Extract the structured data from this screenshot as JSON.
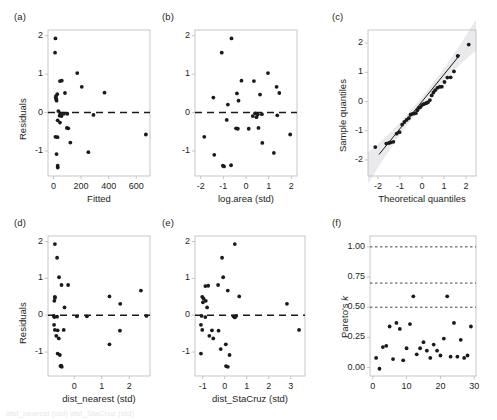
{
  "figure": {
    "width": 497,
    "height": 420,
    "background": "#ffffff",
    "point_color": "#1a1a1a",
    "axis_color": "#b9b9bd",
    "text_color": "#231f20",
    "dashed_line_color": "#1a1a1a",
    "band_color": "#d9d9de",
    "caption_fragment": "dist_nearest (std)  dist_StaCruz (std)"
  },
  "panels": {
    "a": {
      "label": "(a)",
      "xlabel": "Fitted",
      "ylabel": "Residuals"
    },
    "b": {
      "label": "(b)",
      "xlabel": "log.area (std)",
      "ylabel": ""
    },
    "c": {
      "label": "(c)",
      "xlabel": "Theoretical quantiles",
      "ylabel": "Sample quantiles"
    },
    "d": {
      "label": "(d)",
      "xlabel": "dist_nearest (std)",
      "ylabel": "Residuals"
    },
    "e": {
      "label": "(e)",
      "xlabel": "dist_StaCruz (std)",
      "ylabel": ""
    },
    "f": {
      "label": "(f)",
      "xlabel": "",
      "ylabel": "Pareto's k"
    }
  },
  "chart_data": [
    {
      "id": "a",
      "type": "scatter",
      "title": "(a)",
      "xlabel": "Fitted",
      "ylabel": "Residuals",
      "xlim": [
        -40,
        700
      ],
      "ylim": [
        -1.65,
        2.15
      ],
      "xticks": [
        0,
        200,
        400,
        600
      ],
      "yticks": [
        -1,
        0,
        1,
        2
      ],
      "xticklabels": [
        "0",
        "200",
        "400",
        "600"
      ],
      "yticklabels": [
        "-1",
        "0",
        "1",
        "2"
      ],
      "grid": false,
      "reference_line": {
        "type": "hline",
        "y": 0,
        "style": "dashed"
      },
      "points": [
        [
          14,
          1.93
        ],
        [
          11,
          1.56
        ],
        [
          172,
          1.03
        ],
        [
          60,
          0.83
        ],
        [
          47,
          0.82
        ],
        [
          205,
          0.67
        ],
        [
          370,
          0.52
        ],
        [
          83,
          0.51
        ],
        [
          27,
          0.48
        ],
        [
          18,
          0.43
        ],
        [
          16,
          0.39
        ],
        [
          20,
          0.35
        ],
        [
          22,
          0.31
        ],
        [
          35,
          0.04
        ],
        [
          50,
          -0.02
        ],
        [
          75,
          -0.03
        ],
        [
          100,
          -0.03
        ],
        [
          290,
          -0.06
        ],
        [
          44,
          -0.08
        ],
        [
          58,
          -0.09
        ],
        [
          30,
          -0.2
        ],
        [
          47,
          -0.26
        ],
        [
          97,
          -0.4
        ],
        [
          107,
          -0.41
        ],
        [
          670,
          -0.57
        ],
        [
          14,
          -0.63
        ],
        [
          29,
          -0.64
        ],
        [
          122,
          -0.78
        ],
        [
          22,
          -1.08
        ],
        [
          253,
          -1.03
        ],
        [
          30,
          -1.38
        ],
        [
          31,
          -1.43
        ]
      ]
    },
    {
      "id": "b",
      "type": "scatter",
      "title": "(b)",
      "xlabel": "log.area (std)",
      "ylabel": "Residuals",
      "xlim": [
        -2.25,
        2.25
      ],
      "ylim": [
        -1.65,
        2.15
      ],
      "xticks": [
        -2,
        -1,
        0,
        1,
        2
      ],
      "yticks": [
        -1,
        0,
        1,
        2
      ],
      "xticklabels": [
        "-2",
        "-1",
        "0",
        "1",
        "2"
      ],
      "yticklabels": [
        "-1",
        "0",
        "1",
        "2"
      ],
      "grid": false,
      "reference_line": {
        "type": "hline",
        "y": 0,
        "style": "dashed"
      },
      "points": [
        [
          -0.64,
          1.93
        ],
        [
          -1.07,
          1.56
        ],
        [
          0.97,
          1.03
        ],
        [
          -0.2,
          0.83
        ],
        [
          0.35,
          0.82
        ],
        [
          1.35,
          0.67
        ],
        [
          1.47,
          0.51
        ],
        [
          -0.4,
          0.5
        ],
        [
          0.62,
          0.47
        ],
        [
          -1.44,
          0.39
        ],
        [
          -0.33,
          0.31
        ],
        [
          -0.8,
          0.21
        ],
        [
          0.4,
          -0.02
        ],
        [
          0.52,
          -0.05
        ],
        [
          0.7,
          -0.04
        ],
        [
          1.38,
          -0.07
        ],
        [
          0.3,
          -0.09
        ],
        [
          0.46,
          -0.12
        ],
        [
          -0.85,
          -0.19
        ],
        [
          -0.44,
          -0.41
        ],
        [
          -0.36,
          -0.42
        ],
        [
          0.12,
          -0.42
        ],
        [
          0.55,
          -0.4
        ],
        [
          1.95,
          -0.57
        ],
        [
          -1.84,
          -0.63
        ],
        [
          0.72,
          -0.79
        ],
        [
          -1.4,
          -1.1
        ],
        [
          1.23,
          -1.05
        ],
        [
          -1.02,
          -1.38
        ],
        [
          -0.97,
          -1.4
        ],
        [
          -0.66,
          -1.37
        ]
      ]
    },
    {
      "id": "c",
      "type": "scatter",
      "title": "(c)",
      "xlabel": "Theoretical quantiles",
      "ylabel": "Sample quantiles",
      "xlim": [
        -2.45,
        2.45
      ],
      "ylim": [
        -2.55,
        2.45
      ],
      "xticks": [
        -2,
        -1,
        0,
        1,
        2
      ],
      "yticks": [
        -2,
        -1,
        0,
        1,
        2
      ],
      "xticklabels": [
        "-2",
        "-1",
        "0",
        "1",
        "2"
      ],
      "yticklabels": [
        "-2",
        "-1",
        "0",
        "1",
        "2"
      ],
      "grid": false,
      "reference_line": {
        "type": "qq-line",
        "slope": 0.93,
        "intercept": 0.0
      },
      "confidence_band": true,
      "points": [
        [
          -2.12,
          -1.56
        ],
        [
          -1.62,
          -1.44
        ],
        [
          -1.5,
          -1.42
        ],
        [
          -1.42,
          -1.4
        ],
        [
          -1.3,
          -1.38
        ],
        [
          -1.15,
          -1.1
        ],
        [
          -1.02,
          -1.05
        ],
        [
          -0.9,
          -0.79
        ],
        [
          -0.8,
          -0.7
        ],
        [
          -0.7,
          -0.63
        ],
        [
          -0.6,
          -0.57
        ],
        [
          -0.52,
          -0.45
        ],
        [
          -0.44,
          -0.42
        ],
        [
          -0.36,
          -0.41
        ],
        [
          -0.28,
          -0.4
        ],
        [
          -0.21,
          -0.3
        ],
        [
          -0.14,
          -0.22
        ],
        [
          -0.07,
          -0.19
        ],
        [
          0.0,
          -0.12
        ],
        [
          0.07,
          -0.09
        ],
        [
          0.14,
          -0.07
        ],
        [
          0.21,
          -0.05
        ],
        [
          0.28,
          -0.02
        ],
        [
          0.36,
          0.05
        ],
        [
          0.44,
          0.21
        ],
        [
          0.52,
          0.31
        ],
        [
          0.6,
          0.39
        ],
        [
          0.7,
          0.47
        ],
        [
          0.8,
          0.5
        ],
        [
          0.9,
          0.51
        ],
        [
          1.02,
          0.67
        ],
        [
          1.15,
          0.82
        ],
        [
          1.3,
          0.83
        ],
        [
          1.45,
          1.03
        ],
        [
          1.62,
          1.56
        ],
        [
          2.12,
          1.95
        ]
      ]
    },
    {
      "id": "d",
      "type": "scatter",
      "title": "(d)",
      "xlabel": "dist_nearest (std)",
      "ylabel": "Residuals",
      "xlim": [
        -0.95,
        2.75
      ],
      "ylim": [
        -1.65,
        2.15
      ],
      "xticks": [
        0,
        1,
        2
      ],
      "yticks": [
        -1,
        0,
        1,
        2
      ],
      "xticklabels": [
        "0",
        "1",
        "2"
      ],
      "yticklabels": [
        "-1",
        "0",
        "1",
        "2"
      ],
      "grid": false,
      "reference_line": {
        "type": "hline",
        "y": 0,
        "style": "dashed"
      },
      "points": [
        [
          -0.7,
          1.93
        ],
        [
          -0.62,
          1.56
        ],
        [
          -0.55,
          1.03
        ],
        [
          -0.46,
          0.82
        ],
        [
          -0.22,
          0.82
        ],
        [
          2.42,
          0.67
        ],
        [
          1.28,
          0.51
        ],
        [
          1.67,
          0.31
        ],
        [
          -0.7,
          0.5
        ],
        [
          -0.7,
          0.47
        ],
        [
          -0.72,
          0.39
        ],
        [
          -0.35,
          0.21
        ],
        [
          -0.74,
          -0.02
        ],
        [
          -0.72,
          -0.05
        ],
        [
          -0.62,
          -0.04
        ],
        [
          0.1,
          -0.03
        ],
        [
          0.46,
          -0.03
        ],
        [
          2.62,
          -0.02
        ],
        [
          -0.73,
          -0.26
        ],
        [
          -0.7,
          -0.4
        ],
        [
          -0.6,
          -0.41
        ],
        [
          -0.38,
          -0.4
        ],
        [
          1.66,
          -0.42
        ],
        [
          -0.65,
          -0.56
        ],
        [
          -0.56,
          -0.63
        ],
        [
          1.28,
          -0.79
        ],
        [
          -0.6,
          -1.04
        ],
        [
          -0.52,
          -1.08
        ],
        [
          -0.5,
          -1.38
        ],
        [
          -0.45,
          -1.4
        ],
        [
          -0.47,
          -1.37
        ]
      ]
    },
    {
      "id": "e",
      "type": "scatter",
      "title": "(e)",
      "xlabel": "dist_StaCruz (std)",
      "ylabel": "Residuals",
      "xlim": [
        -1.35,
        3.65
      ],
      "ylim": [
        -1.65,
        2.15
      ],
      "xticks": [
        -1,
        0,
        1,
        2,
        3
      ],
      "yticks": [
        -1,
        0,
        1,
        2
      ],
      "xticklabels": [
        "-1",
        "0",
        "1",
        "2",
        "3"
      ],
      "yticklabels": [
        "-1",
        "0",
        "1",
        "2"
      ],
      "grid": false,
      "reference_line": {
        "type": "hline",
        "y": 0,
        "style": "dashed"
      },
      "points": [
        [
          0.46,
          1.93
        ],
        [
          -0.12,
          1.56
        ],
        [
          -0.07,
          1.03
        ],
        [
          -0.3,
          0.82
        ],
        [
          -0.75,
          0.8
        ],
        [
          -0.88,
          0.79
        ],
        [
          0.14,
          0.67
        ],
        [
          0.66,
          0.51
        ],
        [
          2.83,
          0.31
        ],
        [
          -1.02,
          0.5
        ],
        [
          -0.96,
          0.45
        ],
        [
          -0.86,
          0.39
        ],
        [
          -0.99,
          0.35
        ],
        [
          -0.8,
          0.21
        ],
        [
          -1.05,
          -0.02
        ],
        [
          -0.88,
          -0.05
        ],
        [
          0.4,
          -0.03
        ],
        [
          0.46,
          -0.06
        ],
        [
          0.52,
          -0.02
        ],
        [
          -1.08,
          -0.26
        ],
        [
          -1.02,
          -0.4
        ],
        [
          -0.58,
          -0.41
        ],
        [
          -0.28,
          -0.42
        ],
        [
          3.38,
          -0.4
        ],
        [
          -0.7,
          -0.56
        ],
        [
          -0.52,
          -0.63
        ],
        [
          0.05,
          -0.79
        ],
        [
          -0.18,
          -0.92
        ],
        [
          -1.08,
          -1.04
        ],
        [
          0.22,
          -1.08
        ],
        [
          0.06,
          -1.38
        ],
        [
          0.14,
          -1.4
        ]
      ]
    },
    {
      "id": "f",
      "type": "scatter",
      "title": "(f)",
      "xlabel": "",
      "ylabel": "Pareto's k",
      "xlim": [
        -0.8,
        30.5
      ],
      "ylim": [
        -0.07,
        1.09
      ],
      "xticks": [
        0,
        10,
        20,
        30
      ],
      "yticks": [
        0.0,
        0.25,
        0.5,
        0.75,
        1.0
      ],
      "xticklabels": [
        "0",
        "10",
        "20",
        "30"
      ],
      "yticklabels": [
        "0.00",
        "0.25",
        "0.50",
        "0.75",
        "1.00"
      ],
      "grid": false,
      "hlines": [
        {
          "y": 0.5,
          "style": "dashed"
        },
        {
          "y": 0.7,
          "style": "dashed"
        },
        {
          "y": 1.0,
          "style": "dashed"
        }
      ],
      "points": [
        [
          1,
          0.08
        ],
        [
          2,
          -0.01
        ],
        [
          3,
          0.17
        ],
        [
          4,
          0.18
        ],
        [
          5,
          0.34
        ],
        [
          6,
          0.07
        ],
        [
          7,
          0.37
        ],
        [
          8,
          0.32
        ],
        [
          9,
          0.06
        ],
        [
          10,
          0.16
        ],
        [
          11,
          0.36
        ],
        [
          12,
          0.59
        ],
        [
          13,
          0.11
        ],
        [
          14,
          0.16
        ],
        [
          15,
          0.21
        ],
        [
          16,
          0.14
        ],
        [
          17,
          0.08
        ],
        [
          18,
          0.19
        ],
        [
          19,
          0.14
        ],
        [
          20,
          0.1
        ],
        [
          21,
          0.24
        ],
        [
          22,
          0.59
        ],
        [
          23,
          0.09
        ],
        [
          24,
          0.37
        ],
        [
          25,
          0.09
        ],
        [
          26,
          0.23
        ],
        [
          27,
          0.08
        ],
        [
          28,
          0.1
        ],
        [
          29,
          0.34
        ]
      ]
    }
  ]
}
